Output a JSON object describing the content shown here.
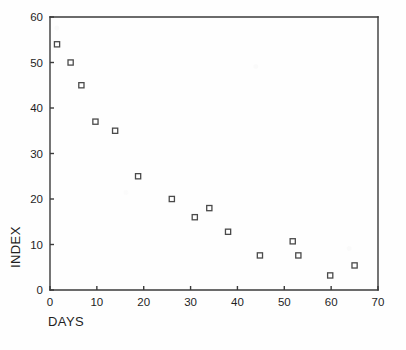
{
  "figure": {
    "background_color": "#fefefe",
    "ink_color": "#3a3a3a",
    "title_remnant": "..........."
  },
  "labels": {
    "x_axis_title": "DAYS",
    "y_axis_title": "INDEX"
  },
  "chart_data": {
    "type": "scatter",
    "title": "",
    "xlabel": "DAYS",
    "ylabel": "INDEX",
    "xlim": [
      0,
      70
    ],
    "ylim": [
      0,
      60
    ],
    "xticks": [
      0,
      10,
      20,
      30,
      40,
      50,
      60,
      70
    ],
    "yticks": [
      0,
      10,
      20,
      30,
      40,
      50,
      60
    ],
    "grid": false,
    "legend": null,
    "marker": "open-square",
    "series": [
      {
        "name": "index-vs-days",
        "points": [
          {
            "x": 1.5,
            "y": 54
          },
          {
            "x": 4.4,
            "y": 50
          },
          {
            "x": 6.7,
            "y": 45
          },
          {
            "x": 9.7,
            "y": 37
          },
          {
            "x": 13.9,
            "y": 35
          },
          {
            "x": 18.8,
            "y": 25
          },
          {
            "x": 26.0,
            "y": 20
          },
          {
            "x": 30.9,
            "y": 16
          },
          {
            "x": 34.0,
            "y": 18
          },
          {
            "x": 38.0,
            "y": 12.8
          },
          {
            "x": 44.8,
            "y": 7.6
          },
          {
            "x": 51.8,
            "y": 10.7
          },
          {
            "x": 53.0,
            "y": 7.6
          },
          {
            "x": 59.8,
            "y": 3.2
          },
          {
            "x": 65.0,
            "y": 5.4
          }
        ]
      }
    ]
  },
  "geometry": {
    "plot_left": 50,
    "plot_right": 378,
    "plot_top": 17,
    "plot_bottom": 290
  }
}
